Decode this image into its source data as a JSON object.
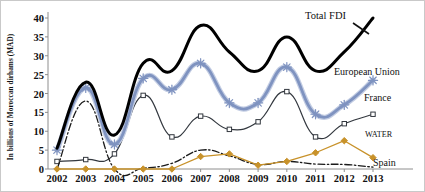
{
  "chart_data": {
    "type": "line",
    "title": "",
    "xlabel": "",
    "ylabel": "In billions of Moroccan dirhams (MAD)",
    "categories": [
      "2002",
      "2003",
      "2004",
      "2005",
      "2006",
      "2007",
      "2008",
      "2009",
      "2010",
      "2011",
      "2012",
      "2013"
    ],
    "ylim": [
      0,
      40
    ],
    "yticks": [
      0,
      5,
      10,
      15,
      20,
      25,
      30,
      35,
      40
    ],
    "grid": false,
    "legend_position": "inline-right-annotations",
    "series": [
      {
        "name": "Total FDI",
        "color": "#000000",
        "marker": "none",
        "linestyle": "solid-thick-smoothed",
        "values": [
          5.5,
          23.0,
          9.0,
          28.0,
          26.0,
          38.0,
          31.0,
          26.0,
          35.0,
          26.0,
          31.0,
          40.0
        ]
      },
      {
        "name": "European Union",
        "color": "#7f93c0",
        "marker": "asterisk",
        "linestyle": "solid-thick-smoothed",
        "values": [
          5.0,
          21.5,
          6.5,
          24.0,
          21.0,
          28.0,
          17.5,
          17.5,
          27.0,
          14.5,
          17.0,
          23.5
        ]
      },
      {
        "name": "France",
        "color": "#33383f",
        "marker": "square",
        "linestyle": "solid-thin-smoothed",
        "values": [
          2.0,
          2.5,
          4.0,
          19.5,
          8.5,
          14.0,
          10.5,
          12.5,
          20.5,
          8.5,
          12.0,
          14.5
        ]
      },
      {
        "name": "WATER",
        "color": "#c8922a",
        "marker": "diamond",
        "linestyle": "solid-thin-straight",
        "values": [
          0.0,
          0.0,
          0.0,
          0.0,
          0.0,
          3.3,
          4.0,
          1.0,
          2.0,
          4.3,
          7.5,
          3.0
        ]
      },
      {
        "name": "Spain",
        "color": "#1a1a1a",
        "marker": "none",
        "linestyle": "dash-dot-smoothed",
        "values": [
          0.0,
          18.0,
          0.0,
          0.2,
          1.5,
          5.0,
          3.5,
          1.2,
          2.0,
          1.3,
          1.2,
          0.5
        ]
      }
    ],
    "annotations": [
      {
        "text": "Total FDI",
        "series": "Total FDI"
      },
      {
        "text": "European Union",
        "series": "European Union"
      },
      {
        "text": "France",
        "series": "France"
      },
      {
        "text": "WATER",
        "series": "WATER"
      },
      {
        "text": "Spain",
        "series": "Spain"
      }
    ]
  }
}
